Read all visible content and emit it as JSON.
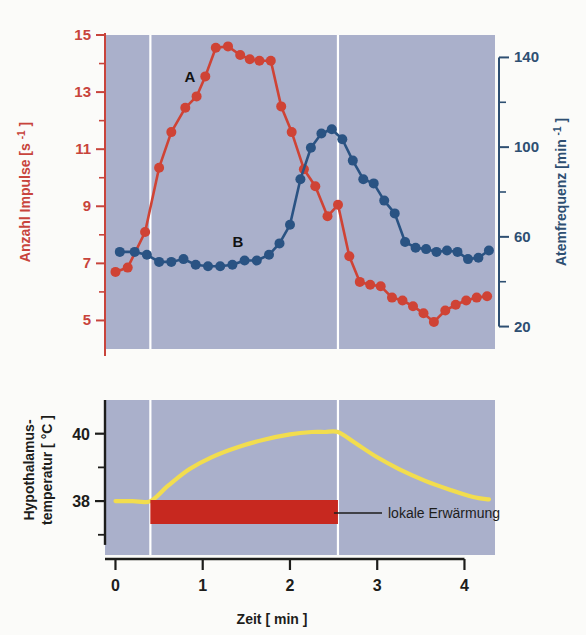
{
  "figure": {
    "background": "#fbfbf9",
    "panel_background": "#aab0cb",
    "colors": {
      "red": "#cf4335",
      "blue": "#2a5383",
      "yellow": "#f2dd4e",
      "bar_red": "#c7281f",
      "gridline": "#ffffff",
      "axis_dark": "#1d1d1b"
    }
  },
  "top_panel": {
    "y_axis_left": {
      "title_main": "Anzahl Impulse",
      "title_unit": "[s",
      "title_unit_sup": "-1",
      "title_unit_close": "]",
      "ticks": [
        15,
        13,
        11,
        9,
        7,
        5
      ],
      "minor_ticks": [
        14,
        12,
        10,
        8,
        6
      ],
      "range": [
        4,
        15
      ],
      "color": "#c8443c"
    },
    "y_axis_right": {
      "title_main": "Atemfrequenz",
      "title_unit": "[min",
      "title_unit_sup": "-1",
      "title_unit_close": "]",
      "ticks": [
        140,
        100,
        60,
        20
      ],
      "minor_ticks": [
        120,
        80,
        40
      ],
      "range": [
        10,
        150
      ],
      "color": "#2e4f72"
    },
    "series_labels": {
      "a": "A",
      "b": "B"
    }
  },
  "bottom_panel": {
    "y_axis": {
      "title_line1": "Hypothalamus-",
      "title_line2": "temperatur",
      "title_unit": "[ °C ]",
      "ticks": [
        40,
        38
      ],
      "minor_ticks": [
        39,
        37
      ],
      "range": [
        36.4,
        41.0
      ],
      "color": "#1d1d1b"
    },
    "annotation": {
      "label": "lokale Erwärmung",
      "bar_start_min": 0.4,
      "bar_end_min": 2.55
    }
  },
  "x_axis": {
    "title_main": "Zeit",
    "title_unit": "[ min ]",
    "ticks": [
      0,
      1,
      2,
      3,
      4
    ],
    "range": [
      -0.12,
      4.35
    ],
    "color": "#1d1d1b"
  },
  "chart_data": {
    "type": "line",
    "title": "",
    "xlabel": "Zeit [min]",
    "panels": [
      {
        "name": "neural-and-respiratory-panel",
        "ylabel_left": "Anzahl Impulse [s-1]",
        "ylabel_right": "Atemfrequenz [min-1]",
        "ylim_left": [
          4,
          15
        ],
        "ylim_right": [
          10,
          150
        ],
        "xlim": [
          -0.12,
          4.35
        ],
        "grid": "vertical-white-at-0.4-and-2.55",
        "series": [
          {
            "name": "A",
            "label": "A",
            "axis": "left",
            "color": "#cf4335",
            "marker": "filled-circle",
            "x": [
              0.0,
              0.14,
              0.34,
              0.5,
              0.64,
              0.8,
              0.93,
              1.03,
              1.15,
              1.29,
              1.43,
              1.54,
              1.65,
              1.78,
              1.9,
              2.02,
              2.16,
              2.29,
              2.43,
              2.55,
              2.68,
              2.8,
              2.92,
              3.04,
              3.17,
              3.29,
              3.41,
              3.53,
              3.65,
              3.78,
              3.9,
              4.02,
              4.14,
              4.26
            ],
            "y": [
              6.7,
              6.85,
              8.1,
              10.35,
              11.6,
              12.45,
              12.85,
              13.55,
              14.55,
              14.6,
              14.3,
              14.15,
              14.1,
              14.1,
              12.5,
              11.6,
              10.3,
              9.7,
              8.65,
              9.05,
              7.25,
              6.35,
              6.25,
              6.2,
              5.8,
              5.7,
              5.5,
              5.25,
              4.95,
              5.35,
              5.55,
              5.7,
              5.8,
              5.85
            ]
          },
          {
            "name": "B",
            "label": "B",
            "axis": "right",
            "color": "#2a5383",
            "marker": "filled-circle",
            "x": [
              0.05,
              0.22,
              0.36,
              0.5,
              0.64,
              0.78,
              0.92,
              1.06,
              1.2,
              1.34,
              1.48,
              1.62,
              1.76,
              1.88,
              2.0,
              2.12,
              2.24,
              2.36,
              2.48,
              2.6,
              2.72,
              2.84,
              2.96,
              3.08,
              3.2,
              3.32,
              3.44,
              3.56,
              3.68,
              3.8,
              3.92,
              4.04,
              4.16,
              4.28
            ],
            "y_left_equiv": [
              7.4,
              7.4,
              7.3,
              7.05,
              7.05,
              7.15,
              6.95,
              6.9,
              6.9,
              6.95,
              7.1,
              7.1,
              7.3,
              7.7,
              8.35,
              9.95,
              11.05,
              11.55,
              11.7,
              11.35,
              10.6,
              9.95,
              9.8,
              9.2,
              8.75,
              7.75,
              7.55,
              7.5,
              7.4,
              7.45,
              7.4,
              7.15,
              7.2,
              7.45
            ],
            "y": [
              43,
              43,
              41,
              37,
              37,
              38,
              35,
              34,
              34,
              35,
              37,
              37,
              41,
              46,
              55,
              78,
              93,
              100,
              102,
              97,
              87,
              78,
              76,
              67,
              61,
              47,
              44,
              44,
              43,
              43,
              43,
              39,
              40,
              43
            ]
          }
        ]
      },
      {
        "name": "hypothalamus-temperature-panel",
        "ylabel": "Hypothalamus-temperatur [ °C ]",
        "ylim": [
          36.4,
          41.0
        ],
        "xlim": [
          -0.12,
          4.35
        ],
        "series": [
          {
            "name": "hypothalamus-temperature",
            "color": "#f2dd4e",
            "marker": "none",
            "x": [
              0.0,
              0.2,
              0.4,
              0.6,
              0.85,
              1.1,
              1.4,
              1.7,
              2.0,
              2.25,
              2.4,
              2.55,
              2.75,
              3.0,
              3.25,
              3.55,
              3.85,
              4.1,
              4.28
            ],
            "y": [
              38.0,
              38.0,
              38.0,
              38.45,
              38.95,
              39.3,
              39.6,
              39.82,
              39.98,
              40.05,
              40.05,
              40.05,
              39.72,
              39.3,
              38.95,
              38.6,
              38.32,
              38.12,
              38.05
            ]
          }
        ],
        "annotations": [
          {
            "type": "span-bar",
            "label": "lokale Erwärmung",
            "color": "#c7281f",
            "x_start": 0.4,
            "x_end": 2.55
          }
        ]
      }
    ]
  }
}
